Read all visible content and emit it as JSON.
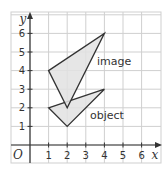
{
  "diagram": {
    "type": "coordinate-grid-transformation",
    "axes": {
      "x_label": "x",
      "y_label": "y",
      "origin_label": "O",
      "x_ticks": [
        "1",
        "2",
        "3",
        "4",
        "5",
        "6"
      ],
      "y_ticks": [
        "1",
        "2",
        "3",
        "4",
        "5",
        "6"
      ],
      "x_range": [
        -1,
        7
      ],
      "y_range": [
        -1,
        7
      ]
    },
    "shapes": [
      {
        "name": "object",
        "label": "object",
        "vertices": [
          [
            1,
            2
          ],
          [
            4,
            3
          ],
          [
            2,
            1
          ]
        ],
        "fill": "#e2e2e2",
        "stroke": "#333333"
      },
      {
        "name": "image",
        "label": "image",
        "vertices": [
          [
            1,
            4
          ],
          [
            4,
            6
          ],
          [
            2,
            2
          ]
        ],
        "fill": "#e2e2e2",
        "stroke": "#333333"
      }
    ],
    "colors": {
      "grid": "#cfcfcf",
      "axis": "#333333",
      "background": "#ffffff"
    }
  }
}
